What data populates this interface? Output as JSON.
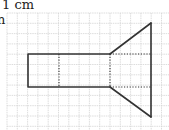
{
  "scale_label_line1": "1 cm",
  "scale_label_line2": "n",
  "grid": {
    "x0": 7,
    "y0": 13,
    "step": 10.3,
    "cols": 16,
    "rows": 12,
    "color": "#d4d4d4"
  },
  "figure": {
    "stroke": "#333333",
    "rectangle": {
      "x1": 28,
      "y1": 54,
      "x2": 110,
      "y2": 87
    },
    "inner_dotted_vertical_x": 59,
    "apex_x": 151,
    "top_point_y": 23,
    "bottom_point_y": 117
  }
}
